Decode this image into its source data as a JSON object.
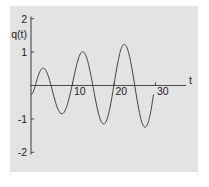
{
  "figure": {
    "panel_background": "#e3e3e3",
    "page_background": "#ffffff",
    "curve_color": "#3c3c3c",
    "axis_color": "#4a4a4a",
    "caption_fragment": "",
    "y_axis_label": "q(t)",
    "x_axis_label": "t"
  },
  "chart_data": {
    "type": "line",
    "title": "",
    "xlabel": "t",
    "ylabel": "q(t)",
    "xlim": [
      0,
      32
    ],
    "ylim": [
      -2.2,
      2.2
    ],
    "grid": false,
    "legend": null,
    "x_ticks": [
      10,
      20,
      30
    ],
    "x_tick_labels": [
      "10",
      "20",
      "30"
    ],
    "y_ticks": [
      2,
      1,
      -1,
      -2
    ],
    "y_tick_labels": [
      "2",
      "1",
      "-1",
      "-2"
    ],
    "series": [
      {
        "name": "q(t)",
        "x": [
          0.0,
          0.5,
          1.0,
          1.5,
          2.0,
          2.5,
          3.0,
          3.5,
          4.0,
          4.5,
          5.0,
          5.5,
          6.0,
          6.5,
          7.0,
          7.5,
          8.0,
          8.5,
          9.0,
          9.5,
          10.0,
          10.5,
          11.0,
          11.5,
          12.0,
          12.5,
          13.0,
          13.5,
          14.0,
          14.5,
          15.0,
          15.5,
          16.0,
          16.5,
          17.0,
          17.5,
          18.0,
          18.5,
          19.0,
          19.5,
          20.0,
          20.5,
          21.0,
          21.5,
          22.0,
          22.5,
          23.0,
          23.5,
          24.0,
          24.5,
          25.0,
          25.5,
          26.0,
          26.5,
          27.0,
          27.5,
          28.0,
          28.5,
          29.0,
          29.5
        ],
        "y": [
          -0.28,
          -0.2,
          -0.02,
          0.2,
          0.38,
          0.49,
          0.52,
          0.47,
          0.34,
          0.15,
          -0.08,
          -0.32,
          -0.54,
          -0.71,
          -0.82,
          -0.85,
          -0.8,
          -0.67,
          -0.47,
          -0.22,
          0.06,
          0.35,
          0.62,
          0.83,
          0.97,
          1.01,
          0.95,
          0.8,
          0.56,
          0.26,
          -0.07,
          -0.4,
          -0.7,
          -0.94,
          -1.1,
          -1.15,
          -1.1,
          -0.94,
          -0.68,
          -0.35,
          0.02,
          0.4,
          0.74,
          1.01,
          1.18,
          1.23,
          1.17,
          0.99,
          0.72,
          0.38,
          0.0,
          -0.38,
          -0.73,
          -1.01,
          -1.19,
          -1.25,
          -1.18,
          -0.99,
          -0.68,
          -0.28
        ],
        "style": "solid"
      }
    ]
  }
}
